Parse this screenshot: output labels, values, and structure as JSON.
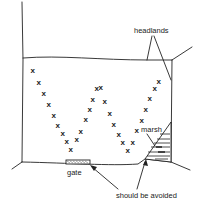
{
  "diagram": {
    "type": "field-layout-sketch",
    "labels": {
      "headlands": "headlands",
      "marsh": "marsh",
      "gate": "gate",
      "avoid": "should be avoided"
    },
    "marker_glyph": "x",
    "colors": {
      "ink": "#222222",
      "background": "#ffffff"
    },
    "path_markers": [
      {
        "x": 33,
        "y": 70
      },
      {
        "x": 39,
        "y": 82
      },
      {
        "x": 44,
        "y": 93
      },
      {
        "x": 49,
        "y": 104
      },
      {
        "x": 54,
        "y": 115
      },
      {
        "x": 58,
        "y": 125
      },
      {
        "x": 63,
        "y": 133
      },
      {
        "x": 67,
        "y": 141
      },
      {
        "x": 71,
        "y": 149
      },
      {
        "x": 77,
        "y": 139
      },
      {
        "x": 81,
        "y": 131
      },
      {
        "x": 86,
        "y": 119
      },
      {
        "x": 90,
        "y": 109
      },
      {
        "x": 93,
        "y": 99
      },
      {
        "x": 97,
        "y": 88
      },
      {
        "x": 101,
        "y": 87
      },
      {
        "x": 105,
        "y": 101
      },
      {
        "x": 110,
        "y": 113
      },
      {
        "x": 114,
        "y": 124
      },
      {
        "x": 119,
        "y": 134
      },
      {
        "x": 123,
        "y": 142
      },
      {
        "x": 128,
        "y": 150
      },
      {
        "x": 133,
        "y": 142
      },
      {
        "x": 137,
        "y": 130
      },
      {
        "x": 142,
        "y": 120
      },
      {
        "x": 146,
        "y": 109
      },
      {
        "x": 150,
        "y": 98
      },
      {
        "x": 155,
        "y": 88
      },
      {
        "x": 159,
        "y": 81
      }
    ]
  }
}
